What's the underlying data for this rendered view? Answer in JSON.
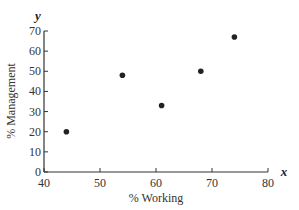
{
  "chart_data": {
    "type": "scatter",
    "title": "",
    "xlabel": "% Working",
    "ylabel": "% Management",
    "x_var": "x",
    "y_var": "y",
    "xlim": [
      40,
      80
    ],
    "ylim": [
      0,
      70
    ],
    "x_ticks": [
      40,
      50,
      60,
      70,
      80
    ],
    "y_ticks": [
      0,
      10,
      20,
      30,
      40,
      50,
      60,
      70
    ],
    "grid": false,
    "legend": null,
    "points": [
      {
        "x": 44,
        "y": 20
      },
      {
        "x": 54,
        "y": 48
      },
      {
        "x": 61,
        "y": 33
      },
      {
        "x": 68,
        "y": 50
      },
      {
        "x": 74,
        "y": 67
      }
    ],
    "marker_color": "#222222"
  }
}
